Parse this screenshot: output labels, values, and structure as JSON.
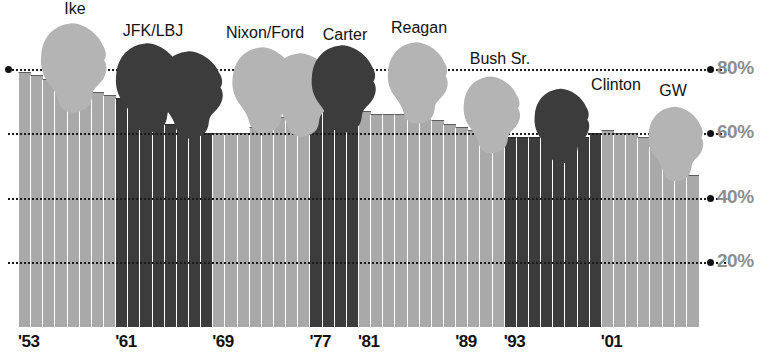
{
  "chart_data": {
    "type": "bar",
    "title": "",
    "subtitle": "",
    "xlabel": "",
    "ylabel": "",
    "ylim": [
      0,
      100
    ],
    "grid": true,
    "legend_position": "none",
    "ytick_labels": [
      "80%",
      "60%",
      "40%",
      "20%"
    ],
    "ytick_values": [
      80,
      60,
      40,
      20
    ],
    "xtick_labels": [
      "'53",
      "'61",
      "'69",
      "'77",
      "'81",
      "'89",
      "'93",
      "'01"
    ],
    "xtick_years": [
      1953,
      1961,
      1969,
      1977,
      1981,
      1989,
      1993,
      2001
    ],
    "categories": [
      1953,
      1954,
      1955,
      1956,
      1957,
      1958,
      1959,
      1960,
      1961,
      1962,
      1963,
      1964,
      1965,
      1966,
      1967,
      1968,
      1969,
      1970,
      1971,
      1972,
      1973,
      1974,
      1975,
      1976,
      1977,
      1978,
      1979,
      1980,
      1981,
      1982,
      1983,
      1984,
      1985,
      1986,
      1987,
      1988,
      1989,
      1990,
      1991,
      1992,
      1993,
      1994,
      1995,
      1996,
      1997,
      1998,
      1999,
      2000,
      2001,
      2002,
      2003,
      2004,
      2005,
      2006,
      2007,
      2008
    ],
    "values": [
      79,
      78,
      77,
      76,
      75,
      74,
      73,
      72,
      71,
      70,
      69,
      64,
      63,
      62,
      61,
      60,
      60,
      60,
      60,
      62,
      64,
      65,
      66,
      67,
      68,
      68,
      67,
      67,
      67,
      66,
      66,
      66,
      65,
      65,
      64,
      63,
      62,
      61,
      60,
      59,
      59,
      59,
      59,
      59,
      59,
      59,
      59,
      60,
      61,
      60,
      60,
      59,
      56,
      53,
      49,
      47
    ],
    "series_shade": [
      "light",
      "light",
      "light",
      "light",
      "light",
      "light",
      "light",
      "light",
      "dark",
      "dark",
      "dark",
      "dark",
      "dark",
      "dark",
      "dark",
      "dark",
      "light",
      "light",
      "light",
      "light",
      "light",
      "light",
      "light",
      "light",
      "dark",
      "dark",
      "dark",
      "dark",
      "light",
      "light",
      "light",
      "light",
      "light",
      "light",
      "light",
      "light",
      "light",
      "light",
      "light",
      "light",
      "dark",
      "dark",
      "dark",
      "dark",
      "dark",
      "dark",
      "dark",
      "dark",
      "light",
      "light",
      "light",
      "light",
      "light",
      "light",
      "light",
      "light"
    ],
    "presidents": [
      {
        "name": "Ike",
        "term_label": "'53",
        "start_year": 1953,
        "end_year": 1960,
        "shade": "light"
      },
      {
        "name": "JFK/LBJ",
        "term_label": "'61",
        "start_year": 1961,
        "end_year": 1968,
        "shade": "dark"
      },
      {
        "name": "Nixon/Ford",
        "term_label": "'69",
        "start_year": 1969,
        "end_year": 1976,
        "shade": "light"
      },
      {
        "name": "Carter",
        "term_label": "'77",
        "start_year": 1977,
        "end_year": 1980,
        "shade": "dark"
      },
      {
        "name": "Reagan",
        "term_label": "'81",
        "start_year": 1981,
        "end_year": 1988,
        "shade": "light"
      },
      {
        "name": "Bush Sr.",
        "term_label": "'89",
        "start_year": 1989,
        "end_year": 1992,
        "shade": "light"
      },
      {
        "name": "Clinton",
        "term_label": "'93",
        "start_year": 1993,
        "end_year": 2000,
        "shade": "dark"
      },
      {
        "name": "GW",
        "term_label": "'01",
        "start_year": 2001,
        "end_year": 2008,
        "shade": "light"
      }
    ],
    "colors": {
      "bar_light": "#a9a9a9",
      "bar_dark": "#3c3c3c",
      "gridline": "#1a1a1a",
      "ylabel": "#8e8e8e",
      "xlabel": "#111111",
      "background": "#ffffff"
    }
  }
}
